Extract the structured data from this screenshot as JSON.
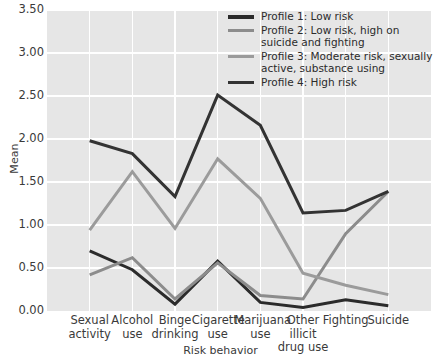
{
  "chart_data": {
    "type": "line",
    "title": "",
    "xlabel": "Risk behavior",
    "ylabel": "Mean",
    "categories": [
      "Sexual activity",
      "Alcohol use",
      "Binge drinking",
      "Cigarette use",
      "Marijuana use",
      "Other illicit drug use",
      "Fighting",
      "Suicide"
    ],
    "ylim": [
      0.0,
      3.5
    ],
    "ytick_labels": [
      "0.00",
      "0.50",
      "1.00",
      "1.50",
      "2.00",
      "2.50",
      "3.00",
      "3.50"
    ],
    "ytick_values": [
      0.0,
      0.5,
      1.0,
      1.5,
      2.0,
      2.5,
      3.0,
      3.5
    ],
    "grid": true,
    "legend_position": "top-right",
    "series": [
      {
        "name": "Profile 1: Low risk",
        "color": "#2b2b2b",
        "values": [
          0.7,
          0.48,
          0.08,
          0.58,
          0.1,
          0.04,
          0.13,
          0.06
        ]
      },
      {
        "name": "Profile 2: Low risk, high on suicide and fighting",
        "color": "#8c8c8c",
        "values": [
          0.42,
          0.62,
          0.14,
          0.56,
          0.18,
          0.14,
          0.9,
          1.39
        ]
      },
      {
        "name": "Profile 3: Moderate risk, sexually active, substance using",
        "color": "#9b9b9b",
        "values": [
          0.94,
          1.62,
          0.96,
          1.77,
          1.31,
          0.44,
          0.3,
          0.19
        ]
      },
      {
        "name": "Profile 4: High risk",
        "color": "#333333",
        "values": [
          1.98,
          1.83,
          1.33,
          2.51,
          2.16,
          1.14,
          1.17,
          1.39
        ]
      }
    ]
  },
  "legend": {
    "items": [
      {
        "label": "Profile 1: Low risk",
        "color": "#2b2b2b"
      },
      {
        "label": "Profile 2: Low risk, high on suicide and fighting",
        "color": "#8c8c8c"
      },
      {
        "label": "Profile 3: Moderate risk, sexually active, substance using",
        "color": "#9b9b9b"
      },
      {
        "label": "Profile 4: High risk",
        "color": "#333333"
      }
    ]
  },
  "colors": {
    "plot_background": "#e6e6e6",
    "gridline": "#ffffff",
    "text": "#3a3a3a"
  }
}
